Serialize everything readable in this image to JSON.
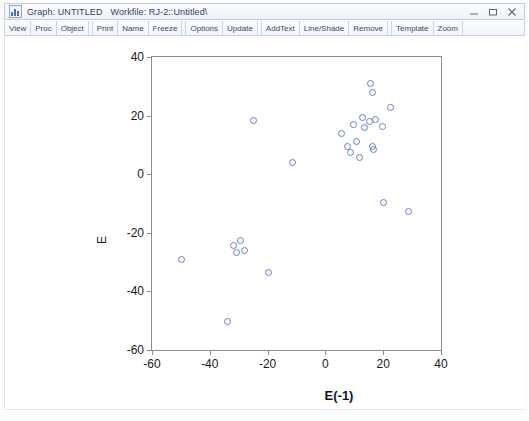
{
  "window": {
    "icon": "graph-window-icon",
    "title_app": "Graph: UNTITLED",
    "title_workfile": "Workfile: RJ-2::Untitled\\",
    "minimize_label": "–",
    "restore_label": "▭",
    "close_label": "✕"
  },
  "toolbar": {
    "buttons": [
      {
        "label": "View",
        "group": 0
      },
      {
        "label": "Proc",
        "group": 0
      },
      {
        "label": "Object",
        "group": 0
      },
      {
        "label": "Print",
        "group": 1
      },
      {
        "label": "Name",
        "group": 1
      },
      {
        "label": "Freeze",
        "group": 1
      },
      {
        "label": "Options",
        "group": 2
      },
      {
        "label": "Update",
        "group": 2
      },
      {
        "label": "AddText",
        "group": 3
      },
      {
        "label": "Line/Shade",
        "group": 3
      },
      {
        "label": "Remove",
        "group": 3
      },
      {
        "label": "Template",
        "group": 4
      },
      {
        "label": "Zoom",
        "group": 4
      }
    ]
  },
  "chart_data": {
    "type": "scatter",
    "title": "",
    "xlabel": "E(-1)",
    "ylabel": "E",
    "xlim": [
      -60,
      40
    ],
    "ylim": [
      -60,
      40
    ],
    "xticks": [
      -60,
      -40,
      -20,
      0,
      20,
      40
    ],
    "yticks": [
      -60,
      -40,
      -20,
      0,
      20,
      40
    ],
    "xticklabels": [
      "-60",
      "-40",
      "-20",
      "0",
      "20",
      "40"
    ],
    "yticklabels": [
      "-60",
      "-40",
      "-20",
      "0",
      "20",
      "40"
    ],
    "grid": false,
    "legend": null,
    "marker": "open-circle",
    "marker_color": "#6a7fbe",
    "points": [
      {
        "x": -50.0,
        "y": -29.0
      },
      {
        "x": -34.0,
        "y": -50.0
      },
      {
        "x": -32.0,
        "y": -24.0
      },
      {
        "x": -31.0,
        "y": -26.5
      },
      {
        "x": -29.5,
        "y": -22.5
      },
      {
        "x": -28.0,
        "y": -26.0
      },
      {
        "x": -25.0,
        "y": 18.5
      },
      {
        "x": -20.0,
        "y": -33.5
      },
      {
        "x": -11.5,
        "y": 4.0
      },
      {
        "x": 5.5,
        "y": 14.0
      },
      {
        "x": 7.5,
        "y": 9.5
      },
      {
        "x": 8.5,
        "y": 7.5
      },
      {
        "x": 9.5,
        "y": 17.0
      },
      {
        "x": 10.5,
        "y": 11.5
      },
      {
        "x": 11.5,
        "y": 6.0
      },
      {
        "x": 12.5,
        "y": 19.5
      },
      {
        "x": 13.5,
        "y": 16.0
      },
      {
        "x": 15.0,
        "y": 18.0
      },
      {
        "x": 15.5,
        "y": 31.0
      },
      {
        "x": 16.0,
        "y": 28.0
      },
      {
        "x": 16.0,
        "y": 9.5
      },
      {
        "x": 16.3,
        "y": 8.5
      },
      {
        "x": 17.0,
        "y": 19.0
      },
      {
        "x": 19.5,
        "y": 16.5
      },
      {
        "x": 20.0,
        "y": -9.5
      },
      {
        "x": 22.5,
        "y": 23.0
      },
      {
        "x": 28.5,
        "y": -12.5
      }
    ]
  }
}
